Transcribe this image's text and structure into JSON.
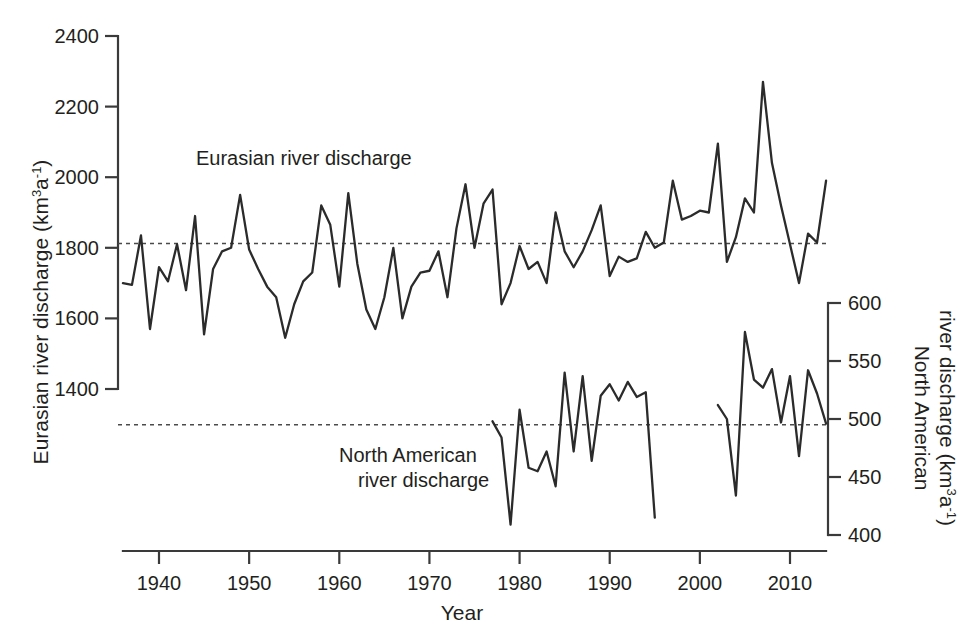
{
  "chart_data": {
    "type": "line",
    "title": "",
    "xlabel": "Year",
    "grid": false,
    "legend_position": "inline-annotations",
    "xlim": [
      1936,
      2014
    ],
    "xticks": [
      1940,
      1950,
      1960,
      1970,
      1980,
      1990,
      2000,
      2010
    ],
    "xticklabels": [
      "1940",
      "1950",
      "1960",
      "1970",
      "1980",
      "1990",
      "2000",
      "2010"
    ],
    "axes": [
      {
        "id": "left",
        "label": "Eurasian river discharge (km3a-1)",
        "label_plain": "Eurasian river discharge (km",
        "label_sup1": "3",
        "label_mid": "a",
        "label_sup2": "-1",
        "label_end": ")",
        "ylim": [
          1400,
          2400
        ],
        "yticks": [
          1400,
          1600,
          1800,
          2000,
          2200,
          2400
        ],
        "yticklabels": [
          "1400",
          "1600",
          "1800",
          "2000",
          "2200",
          "2400"
        ],
        "mean_line_value": 1812
      },
      {
        "id": "right",
        "label": "North American river discharge (km3a-1)",
        "label_plain": "North American",
        "label_line2": "river discharge (km",
        "label_sup1": "3",
        "label_mid": "a",
        "label_sup2": "-1",
        "label_end": ")",
        "ylim": [
          400,
          600
        ],
        "yticks": [
          400,
          450,
          500,
          550,
          600
        ],
        "yticklabels": [
          "400",
          "450",
          "500",
          "550",
          "600"
        ],
        "mean_line_value": 495
      }
    ],
    "series": [
      {
        "name": "Eurasian river discharge",
        "axis": "left",
        "annotation": "Eurasian river discharge",
        "color": "#2b2b2b",
        "x": [
          1936,
          1937,
          1938,
          1939,
          1940,
          1941,
          1942,
          1943,
          1944,
          1945,
          1946,
          1947,
          1948,
          1949,
          1950,
          1951,
          1952,
          1953,
          1954,
          1955,
          1956,
          1957,
          1958,
          1959,
          1960,
          1961,
          1962,
          1963,
          1964,
          1965,
          1966,
          1967,
          1968,
          1969,
          1970,
          1971,
          1972,
          1973,
          1974,
          1975,
          1976,
          1977,
          1978,
          1979,
          1980,
          1981,
          1982,
          1983,
          1984,
          1985,
          1986,
          1987,
          1988,
          1989,
          1990,
          1991,
          1992,
          1993,
          1994,
          1995,
          1996,
          1997,
          1998,
          1999,
          2000,
          2001,
          2002,
          2003,
          2004,
          2005,
          2006,
          2007,
          2008,
          2009,
          2010,
          2011,
          2012,
          2013,
          2014
        ],
        "values": [
          1700,
          1695,
          1835,
          1570,
          1745,
          1705,
          1810,
          1680,
          1890,
          1555,
          1740,
          1790,
          1800,
          1950,
          1795,
          1740,
          1690,
          1660,
          1545,
          1640,
          1705,
          1730,
          1920,
          1865,
          1690,
          1955,
          1755,
          1625,
          1570,
          1660,
          1800,
          1600,
          1690,
          1730,
          1735,
          1790,
          1660,
          1855,
          1980,
          1800,
          1925,
          1965,
          1640,
          1700,
          1805,
          1740,
          1760,
          1700,
          1900,
          1790,
          1745,
          1790,
          1850,
          1920,
          1720,
          1775,
          1760,
          1770,
          1845,
          1800,
          1815,
          1990,
          1880,
          1890,
          1905,
          1900,
          2095,
          1760,
          1830,
          1940,
          1900,
          2270,
          2040,
          1920,
          1810,
          1700,
          1840,
          1815,
          1990
        ]
      },
      {
        "name": "North American river discharge (segment 1)",
        "axis": "right",
        "annotation": "North American river discharge",
        "color": "#2b2b2b",
        "x": [
          1977,
          1978,
          1979,
          1980,
          1981,
          1982,
          1983,
          1984,
          1985,
          1986,
          1987,
          1988,
          1989,
          1990,
          1991,
          1992,
          1993,
          1994,
          1995
        ],
        "values": [
          498,
          484,
          409,
          508,
          458,
          455,
          472,
          442,
          540,
          472,
          537,
          464,
          520,
          530,
          516,
          532,
          519,
          523,
          415
        ]
      },
      {
        "name": "North American river discharge (segment 2)",
        "axis": "right",
        "annotation": "",
        "color": "#2b2b2b",
        "x": [
          2002,
          2003,
          2004,
          2005,
          2006,
          2007,
          2008,
          2009,
          2010,
          2011,
          2012,
          2013,
          2014
        ],
        "values": [
          512,
          500,
          434,
          575,
          534,
          527,
          543,
          497,
          537,
          468,
          542,
          522,
          496
        ]
      }
    ]
  },
  "annotations": {
    "eurasian_label": "Eurasian river discharge",
    "north_american_label_line1": "North American",
    "north_american_label_line2": "river discharge"
  }
}
